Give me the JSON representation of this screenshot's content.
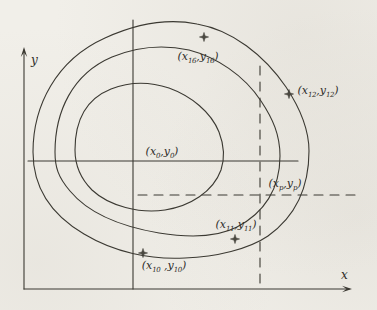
{
  "figure": {
    "type": "nested-closed-contour-curves-diagram",
    "axis_x_label": "x",
    "axis_y_label": "y",
    "curve_count": 3
  },
  "colors": {
    "line": "#3b3932",
    "paper": "#f1efe9",
    "text": "#2e2c29"
  },
  "markers": {
    "glyph_name": "four-point-star-marker",
    "count": 4
  },
  "points": {
    "center": {
      "pre": "(x",
      "x_sub": "0",
      "mid": ",y",
      "y_sub": "0",
      "post": ")"
    },
    "p16": {
      "pre": "(x",
      "x_sub": "16",
      "mid": ",y",
      "y_sub": "16",
      "post": ")"
    },
    "p12": {
      "pre": "(x",
      "x_sub": "12",
      "mid": ",y",
      "y_sub": "12",
      "post": ")"
    },
    "pp": {
      "pre": "(x",
      "x_sub": "p",
      "mid": ",y",
      "y_sub": "p",
      "post": ")"
    },
    "p11": {
      "pre": "(x",
      "x_sub": "11",
      "mid": ",y",
      "y_sub": "11",
      "post": ")"
    },
    "p10": {
      "pre": "(x",
      "x_sub": "10",
      "mid": " ,y",
      "y_sub": "10",
      "post": ")"
    }
  }
}
